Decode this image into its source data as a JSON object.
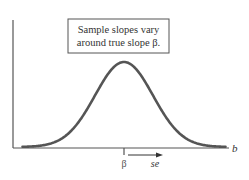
{
  "diagram": {
    "type": "normal-sampling-distribution",
    "annotation": {
      "line1": "Sample slopes vary",
      "line2": "around true slope β."
    },
    "x_axis_label": "b",
    "center_label": "β",
    "spread_label": "se",
    "colors": {
      "curve": "#555555",
      "axis": "#555555",
      "text": "#333333",
      "box_border": "#555555"
    }
  },
  "chart_data": {
    "type": "line",
    "title": "",
    "xlabel": "b",
    "ylabel": "",
    "mean_label": "β",
    "sd_label": "se",
    "x_range_in_sd": [
      -3.5,
      3.5
    ],
    "grid": false
  }
}
